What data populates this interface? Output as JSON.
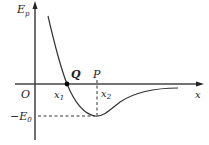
{
  "diagram": {
    "y_axis_label": "E",
    "y_axis_sub": "p",
    "x_axis_label": "x",
    "origin_label": "O",
    "point_q_label": "Q",
    "point_p_label": "P",
    "x1_label": "x",
    "x1_sub": "1",
    "x2_label": "x",
    "x2_sub": "2",
    "min_label_prefix": "−E",
    "min_label_sub": "0"
  }
}
